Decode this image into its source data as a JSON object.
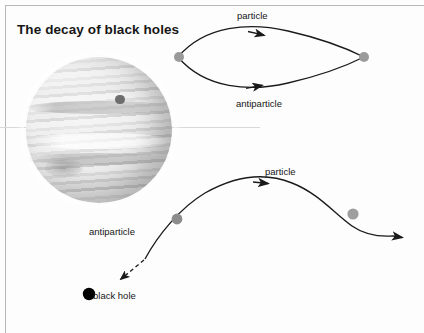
{
  "page": {
    "title": "The decay of black holes",
    "background_color": "#fdfdfd",
    "border_color": "#b8b8b8"
  },
  "figure": {
    "planet": {
      "name": "jupiter-grayscale-photo",
      "description": "grayscale photograph of Jupiter with cloud bands, moon shadow and great red spot"
    },
    "pair_creation_loop": {
      "particle_label": "particle",
      "antiparticle_label": "antiparticle",
      "vertex_color": "#9a9a9a",
      "line_color": "#1a1a1a"
    },
    "escape_diagram": {
      "particle_label": "particle",
      "antiparticle_label": "antiparticle",
      "black_hole_label": "black hole",
      "vertex_color": "#9a9a9a",
      "black_hole_color": "#000000",
      "line_color": "#1a1a1a"
    }
  }
}
